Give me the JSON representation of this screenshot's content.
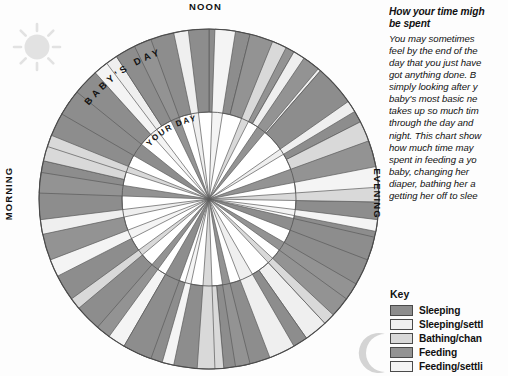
{
  "dial": {
    "noon_label": "NOON",
    "morning_label": "MORNING",
    "evening_label": "EVENING",
    "outer_ring_label": "BABY'S DAY",
    "inner_ring_label": "YOUR DAY"
  },
  "side": {
    "title_line1": "How your time migh",
    "title_line2": "be spent",
    "body_lines": [
      "You may sometimes",
      "feel by the end of the",
      "day that you just have",
      "got anything done. B",
      "simply looking after y",
      "baby's most basic ne",
      "takes up so much tim",
      "through the day and",
      "night. This chart show",
      "how much time may",
      "spent in feeding a yo",
      "baby, changing her",
      "diaper, bathing her a",
      "getting her off to slee"
    ]
  },
  "key": {
    "title": "Key",
    "items": [
      {
        "label": "Sleeping",
        "color": "#8d8d8d"
      },
      {
        "label": "Sleeping/settl",
        "color": "#efefef"
      },
      {
        "label": "Bathing/chan",
        "color": "#d9d9d9"
      },
      {
        "label": "Feeding",
        "color": "#939393"
      },
      {
        "label": "Feeding/settli",
        "color": "#f4f4f4"
      }
    ]
  },
  "icons": {
    "sun": "sun-icon",
    "moon": "crescent-moon-icon"
  },
  "chart_data": {
    "type": "pie",
    "subtype": "dual-ring radial day clock",
    "legend_position": "right",
    "grid": false,
    "center": {
      "x": 209,
      "y": 199
    },
    "outer_radius": 170,
    "inner_radius": 87,
    "start_angle_deg": -90,
    "angle_units": "degrees of a 24-hour clock (15 deg = 1 hour)",
    "colors": {
      "sleeping": "#8d8d8d",
      "sleeping_settling": "#efefef",
      "bathing_changing": "#d9d9d9",
      "feeding": "#939393",
      "feeding_settling": "#f4f4f4",
      "stroke": "#5a5a5a"
    },
    "rings": [
      {
        "name": "BABY'S DAY",
        "radius_from": 87,
        "radius_to": 170,
        "segments": [
          {
            "category": "Sleeping",
            "start_deg": 0,
            "sweep_deg": 14
          },
          {
            "category": "Feeding",
            "start_deg": 14,
            "sweep_deg": 16
          },
          {
            "category": "Sleeping/settling",
            "start_deg": 30,
            "sweep_deg": 11
          },
          {
            "category": "Sleeping",
            "start_deg": 41,
            "sweep_deg": 22
          },
          {
            "category": "Bathing/changing",
            "start_deg": 63,
            "sweep_deg": 9
          },
          {
            "category": "Feeding/settling",
            "start_deg": 72,
            "sweep_deg": 19
          },
          {
            "category": "Sleeping",
            "start_deg": 91,
            "sweep_deg": 32
          },
          {
            "category": "Feeding",
            "start_deg": 123,
            "sweep_deg": 14
          },
          {
            "category": "Sleeping/settling",
            "start_deg": 137,
            "sweep_deg": 8
          },
          {
            "category": "Sleeping",
            "start_deg": 145,
            "sweep_deg": 30
          },
          {
            "category": "Bathing/changing",
            "start_deg": 175,
            "sweep_deg": 7
          },
          {
            "category": "Sleeping",
            "start_deg": 182,
            "sweep_deg": 28
          },
          {
            "category": "Feeding/settling",
            "start_deg": 210,
            "sweep_deg": 10
          },
          {
            "category": "Sleeping",
            "start_deg": 220,
            "sweep_deg": 26
          },
          {
            "category": "Feeding",
            "start_deg": 246,
            "sweep_deg": 13
          },
          {
            "category": "Sleeping",
            "start_deg": 259,
            "sweep_deg": 24
          },
          {
            "category": "Bathing/changing",
            "start_deg": 283,
            "sweep_deg": 8
          },
          {
            "category": "Sleeping",
            "start_deg": 291,
            "sweep_deg": 27
          },
          {
            "category": "Sleeping/settling",
            "start_deg": 318,
            "sweep_deg": 9
          },
          {
            "category": "Sleeping",
            "start_deg": 327,
            "sweep_deg": 33
          }
        ]
      },
      {
        "name": "YOUR DAY",
        "radius_from": 0,
        "radius_to": 170,
        "segments": [
          {
            "category": "Feeding/settling",
            "start_deg": 2,
            "sweep_deg": 7
          },
          {
            "category": "Bathing/changing",
            "start_deg": 22,
            "sweep_deg": 5
          },
          {
            "category": "Feeding",
            "start_deg": 34,
            "sweep_deg": 6
          },
          {
            "category": "Sleeping/settling",
            "start_deg": 55,
            "sweep_deg": 4
          },
          {
            "category": "Feeding",
            "start_deg": 70,
            "sweep_deg": 9
          },
          {
            "category": "Bathing/changing",
            "start_deg": 86,
            "sweep_deg": 5
          },
          {
            "category": "Feeding/settling",
            "start_deg": 97,
            "sweep_deg": 4
          },
          {
            "category": "Sleeping",
            "start_deg": 103,
            "sweep_deg": 8
          },
          {
            "category": "Feeding",
            "start_deg": 120,
            "sweep_deg": 6
          },
          {
            "category": "Bathing/changing",
            "start_deg": 133,
            "sweep_deg": 4
          },
          {
            "category": "Sleeping/settling",
            "start_deg": 150,
            "sweep_deg": 9
          },
          {
            "category": "Feeding",
            "start_deg": 166,
            "sweep_deg": 5
          },
          {
            "category": "Bathing/changing",
            "start_deg": 178,
            "sweep_deg": 6
          },
          {
            "category": "Feeding/settling",
            "start_deg": 192,
            "sweep_deg": 4
          },
          {
            "category": "Sleeping",
            "start_deg": 200,
            "sweep_deg": 10
          },
          {
            "category": "Feeding",
            "start_deg": 216,
            "sweep_deg": 5
          },
          {
            "category": "Bathing/changing",
            "start_deg": 230,
            "sweep_deg": 4
          },
          {
            "category": "Feeding/settling",
            "start_deg": 243,
            "sweep_deg": 6
          },
          {
            "category": "Sleeping/settling",
            "start_deg": 258,
            "sweep_deg": 5
          },
          {
            "category": "Feeding",
            "start_deg": 272,
            "sweep_deg": 7
          },
          {
            "category": "Bathing/changing",
            "start_deg": 288,
            "sweep_deg": 4
          },
          {
            "category": "Sleeping",
            "start_deg": 300,
            "sweep_deg": 9
          },
          {
            "category": "Feeding/settling",
            "start_deg": 318,
            "sweep_deg": 5
          },
          {
            "category": "Feeding",
            "start_deg": 334,
            "sweep_deg": 6
          },
          {
            "category": "Sleeping/settling",
            "start_deg": 348,
            "sweep_deg": 5
          }
        ]
      }
    ]
  }
}
